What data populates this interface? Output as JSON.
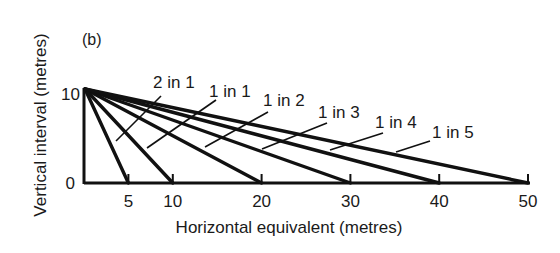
{
  "figure": {
    "panel_label": "(b)",
    "xlabel": "Horizontal equivalent (metres)",
    "ylabel": "Vertical interval (metres)",
    "y_ticks": [
      {
        "value": 0,
        "label": "0"
      },
      {
        "value": 10,
        "label": "10"
      }
    ],
    "x_ticks": [
      {
        "value": 5,
        "label": "5"
      },
      {
        "value": 10,
        "label": "10"
      },
      {
        "value": 20,
        "label": "20"
      },
      {
        "value": 30,
        "label": "30"
      },
      {
        "value": 40,
        "label": "40"
      },
      {
        "value": 50,
        "label": "50"
      }
    ],
    "line_color": "#111111",
    "background": "#ffffff"
  },
  "chart_data": {
    "type": "line",
    "title": "(b)",
    "xlabel": "Horizontal equivalent (metres)",
    "ylabel": "Vertical interval (metres)",
    "xlim": [
      0,
      50
    ],
    "ylim": [
      0,
      10
    ],
    "grid": false,
    "series": [
      {
        "name": "2 in 1",
        "x": [
          0,
          5
        ],
        "y": [
          10,
          0
        ]
      },
      {
        "name": "1 in 1",
        "x": [
          0,
          10
        ],
        "y": [
          10,
          0
        ]
      },
      {
        "name": "1 in 2",
        "x": [
          0,
          20
        ],
        "y": [
          10,
          0
        ]
      },
      {
        "name": "1 in 3",
        "x": [
          0,
          30
        ],
        "y": [
          10,
          0
        ]
      },
      {
        "name": "1 in 4",
        "x": [
          0,
          40
        ],
        "y": [
          10,
          0
        ]
      },
      {
        "name": "1 in 5",
        "x": [
          0,
          50
        ],
        "y": [
          10,
          0
        ]
      }
    ],
    "annotations": [
      {
        "text": "2 in 1",
        "label_x": 153,
        "label_y": 88,
        "leader": [
          161,
          96,
          116,
          141
        ]
      },
      {
        "text": "1 in 1",
        "label_x": 209,
        "label_y": 97,
        "leader": [
          216,
          100,
          147,
          148
        ]
      },
      {
        "text": "1 in 2",
        "label_x": 263,
        "label_y": 106,
        "leader": [
          268,
          112,
          205,
          147
        ]
      },
      {
        "text": "1 in 3",
        "label_x": 318,
        "label_y": 118,
        "leader": [
          327,
          123,
          262,
          149
        ]
      },
      {
        "text": "1 in 4",
        "label_x": 375,
        "label_y": 128,
        "leader": [
          383,
          133,
          330,
          150
        ]
      },
      {
        "text": "1 in 5",
        "label_x": 432,
        "label_y": 138,
        "leader": [
          430,
          141,
          396,
          152
        ]
      }
    ]
  }
}
